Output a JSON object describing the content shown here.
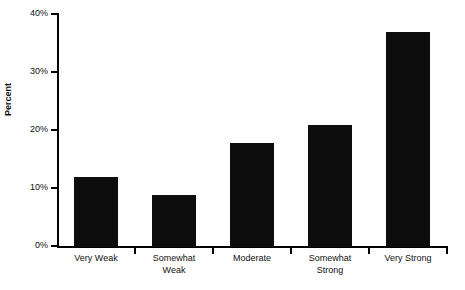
{
  "chart_data": {
    "type": "bar",
    "title": "",
    "xlabel": "",
    "ylabel": "Percent",
    "categories": [
      "Very Weak",
      "Somewhat Weak",
      "Moderate",
      "Somewhat Strong",
      "Very Strong"
    ],
    "category_lines": [
      [
        "Very Weak"
      ],
      [
        "Somewhat",
        "Weak"
      ],
      [
        "Moderate"
      ],
      [
        "Somewhat",
        "Strong"
      ],
      [
        "Very Strong"
      ]
    ],
    "values": [
      12,
      9,
      18,
      21,
      37
    ],
    "value_labels": [
      "12%",
      "9%",
      "18%",
      "21%",
      "37%"
    ],
    "ylim": [
      0,
      40
    ],
    "ytick_values": [
      40,
      30,
      20,
      10,
      0
    ],
    "ytick_labels": [
      "40%",
      "30%",
      "20%",
      "10%",
      "0%"
    ],
    "grid": false,
    "legend": false,
    "bar_color": "#0d0d0d",
    "axis_color": "#000000",
    "background_color": "#ffffff"
  },
  "axes": {
    "y_label": "Percent"
  },
  "ticks": {
    "y": [
      {
        "label": "40%",
        "value": 40
      },
      {
        "label": "30%",
        "value": 30
      },
      {
        "label": "20%",
        "value": 20
      },
      {
        "label": "10%",
        "value": 10
      },
      {
        "label": "0%",
        "value": 0
      }
    ]
  }
}
